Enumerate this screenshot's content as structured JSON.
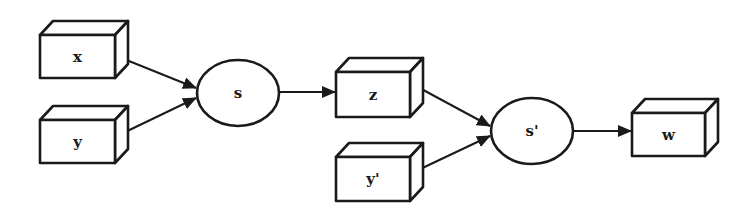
{
  "diagram": {
    "type": "flow-diagram",
    "colors": {
      "stroke": "#1a1a1a",
      "fill": "#ffffff",
      "background": "#ffffff"
    },
    "nodes": [
      {
        "id": "x",
        "label": "x",
        "shape": "box3d",
        "x": 40,
        "y": 35,
        "w": 75,
        "h": 43
      },
      {
        "id": "y",
        "label": "y",
        "shape": "box3d",
        "x": 40,
        "y": 120,
        "w": 75,
        "h": 43
      },
      {
        "id": "s",
        "label": "s",
        "shape": "ellipse",
        "cx": 238,
        "cy": 93,
        "rx": 41,
        "ry": 33
      },
      {
        "id": "z",
        "label": "z",
        "shape": "box3d",
        "x": 336,
        "y": 72,
        "w": 74,
        "h": 45
      },
      {
        "id": "y2",
        "label": "y'",
        "shape": "box3d",
        "x": 336,
        "y": 157,
        "w": 74,
        "h": 44
      },
      {
        "id": "s2",
        "label": "s'",
        "shape": "ellipse",
        "cx": 532,
        "cy": 131,
        "rx": 41,
        "ry": 33
      },
      {
        "id": "w",
        "label": "w",
        "shape": "box3d",
        "x": 632,
        "y": 113,
        "w": 73,
        "h": 43
      }
    ],
    "edges": [
      {
        "from": "x",
        "to": "s",
        "x1": 119,
        "y1": 57,
        "x2": 196,
        "y2": 88
      },
      {
        "from": "y",
        "to": "s",
        "x1": 119,
        "y1": 135,
        "x2": 196,
        "y2": 98
      },
      {
        "from": "s",
        "to": "z",
        "x1": 280,
        "y1": 92,
        "x2": 335,
        "y2": 92
      },
      {
        "from": "z",
        "to": "s2",
        "x1": 414,
        "y1": 85,
        "x2": 490,
        "y2": 126
      },
      {
        "from": "y2",
        "to": "s2",
        "x1": 414,
        "y1": 172,
        "x2": 490,
        "y2": 136
      },
      {
        "from": "s2",
        "to": "w",
        "x1": 574,
        "y1": 131,
        "x2": 631,
        "y2": 131
      }
    ],
    "depth": {
      "dx": 13,
      "dy": -14
    }
  }
}
